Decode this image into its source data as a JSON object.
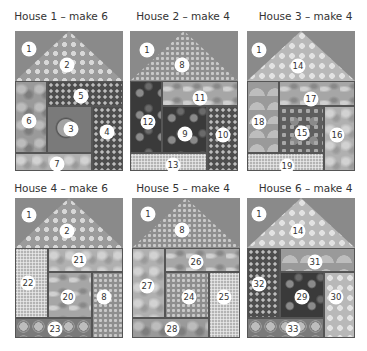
{
  "diagram": {
    "type": "quilt-block-layout",
    "houses": [
      {
        "title": "House 1 – make 6",
        "patches": [
          {
            "id": "1",
            "role": "background"
          },
          {
            "id": "2",
            "role": "roof"
          },
          {
            "id": "5"
          },
          {
            "id": "6"
          },
          {
            "id": "3"
          },
          {
            "id": "4"
          },
          {
            "id": "7"
          }
        ]
      },
      {
        "title": "House 2 – make 4",
        "patches": [
          {
            "id": "1",
            "role": "background"
          },
          {
            "id": "8",
            "role": "roof"
          },
          {
            "id": "11"
          },
          {
            "id": "12"
          },
          {
            "id": "9"
          },
          {
            "id": "10"
          },
          {
            "id": "13"
          }
        ]
      },
      {
        "title": "House 3 – make 4",
        "patches": [
          {
            "id": "1",
            "role": "background"
          },
          {
            "id": "14",
            "role": "roof"
          },
          {
            "id": "17"
          },
          {
            "id": "18"
          },
          {
            "id": "15"
          },
          {
            "id": "16"
          },
          {
            "id": "19"
          }
        ]
      },
      {
        "title": "House 4 – make 6",
        "patches": [
          {
            "id": "1",
            "role": "background"
          },
          {
            "id": "2",
            "role": "roof"
          },
          {
            "id": "22"
          },
          {
            "id": "21"
          },
          {
            "id": "20"
          },
          {
            "id": "8"
          },
          {
            "id": "23"
          }
        ]
      },
      {
        "title": "House 5 – make 4",
        "patches": [
          {
            "id": "1",
            "role": "background"
          },
          {
            "id": "8",
            "role": "roof"
          },
          {
            "id": "27"
          },
          {
            "id": "26"
          },
          {
            "id": "24"
          },
          {
            "id": "25"
          },
          {
            "id": "28"
          }
        ]
      },
      {
        "title": "House 6 – make 4",
        "patches": [
          {
            "id": "1",
            "role": "background"
          },
          {
            "id": "14",
            "role": "roof"
          },
          {
            "id": "32"
          },
          {
            "id": "31"
          },
          {
            "id": "29"
          },
          {
            "id": "30"
          },
          {
            "id": "33"
          }
        ]
      }
    ]
  }
}
